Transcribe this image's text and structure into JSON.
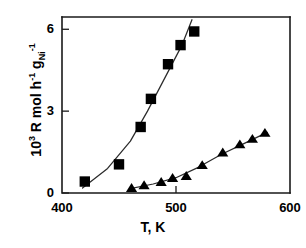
{
  "chart_data": {
    "type": "scatter",
    "title": "",
    "subtitle": "",
    "xlabel": "T, K",
    "ylabel": "10^3 R mol h^-1 g_Ni^-1",
    "ylabel_parts": {
      "prefix_base": "10",
      "prefix_exp": "3",
      "mid": " R mol h",
      "mid_exp": "-1",
      "tail_base": " g",
      "tail_sub": "Ni",
      "tail_exp": "-1"
    },
    "xlim": [
      400,
      600
    ],
    "ylim": [
      0,
      6.45
    ],
    "xticks": [
      400,
      500,
      600
    ],
    "xtick_labels": [
      "400",
      "500",
      "600"
    ],
    "yticks": [
      0,
      3,
      6
    ],
    "ytick_labels": [
      "0",
      "3",
      "6"
    ],
    "grid": false,
    "legend": "none",
    "series": [
      {
        "name": "square-series",
        "marker": "square",
        "color": "#000000",
        "points": [
          {
            "x": 420,
            "y": 0.42
          },
          {
            "x": 450,
            "y": 1.05
          },
          {
            "x": 469,
            "y": 2.42
          },
          {
            "x": 478,
            "y": 3.45
          },
          {
            "x": 493,
            "y": 4.72
          },
          {
            "x": 504,
            "y": 5.42
          },
          {
            "x": 516,
            "y": 5.92
          }
        ],
        "fit_line": [
          {
            "x": 418,
            "y": 0.18
          },
          {
            "x": 440,
            "y": 0.9
          },
          {
            "x": 460,
            "y": 1.9
          },
          {
            "x": 475,
            "y": 3.0
          },
          {
            "x": 490,
            "y": 4.2
          },
          {
            "x": 505,
            "y": 5.4
          },
          {
            "x": 514,
            "y": 6.35
          }
        ]
      },
      {
        "name": "triangle-series",
        "marker": "triangle",
        "color": "#000000",
        "points": [
          {
            "x": 461,
            "y": 0.18
          },
          {
            "x": 472,
            "y": 0.28
          },
          {
            "x": 487,
            "y": 0.4
          },
          {
            "x": 497,
            "y": 0.55
          },
          {
            "x": 509,
            "y": 0.62
          },
          {
            "x": 523,
            "y": 1.02
          },
          {
            "x": 541,
            "y": 1.48
          },
          {
            "x": 556,
            "y": 1.78
          },
          {
            "x": 567,
            "y": 1.98
          },
          {
            "x": 578,
            "y": 2.2
          }
        ],
        "fit_line": [
          {
            "x": 460,
            "y": 0.16
          },
          {
            "x": 480,
            "y": 0.33
          },
          {
            "x": 500,
            "y": 0.56
          },
          {
            "x": 520,
            "y": 0.95
          },
          {
            "x": 540,
            "y": 1.42
          },
          {
            "x": 560,
            "y": 1.82
          },
          {
            "x": 580,
            "y": 2.22
          }
        ]
      }
    ]
  }
}
